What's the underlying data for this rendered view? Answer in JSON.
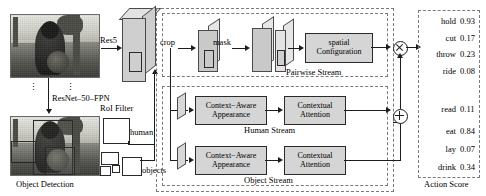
{
  "figure": {
    "left_panel": {
      "caption": "Object Detection",
      "backbone_label": "ResNet–50–FPN",
      "roi_filter_label": "RoI Filter",
      "res5_label": "Res5",
      "human_label": "human",
      "objects_label": "objects"
    },
    "pipeline": {
      "crop_label": "crop",
      "mask_label": "mask",
      "spatial_box": "spatial Configuration",
      "spatial_box_line1": "spatial",
      "spatial_box_line2": "Configuration",
      "pairwise_stream_label": "Pairwise Stream",
      "human_stream_label": "Human Stream",
      "object_stream_label": "Object Stream",
      "context_aware_line1": "Context−Aware",
      "context_aware_line2": "Appearance",
      "contextual_line1": "Contextual",
      "contextual_line2": "Attention",
      "multiply_op": "⊗",
      "add_op": "⊕"
    },
    "action_score": {
      "caption": "Action Score",
      "ellipsis": "⋮",
      "rows": [
        {
          "name": "hold",
          "score": "0.93"
        },
        {
          "name": "cut",
          "score": "0.17"
        },
        {
          "name": "throw",
          "score": "0.23"
        },
        {
          "name": "ride",
          "score": "0.08"
        },
        {
          "name": "read",
          "score": "0.11"
        },
        {
          "name": "eat",
          "score": "0.84"
        },
        {
          "name": "lay",
          "score": "0.07"
        },
        {
          "name": "drink",
          "score": "0.34"
        }
      ]
    },
    "colors": {
      "box_fill": "#d5d5d5",
      "box_border": "#2a2a2a",
      "dashed_border": "#7a7a7a",
      "line": "#1d1d1d"
    }
  }
}
